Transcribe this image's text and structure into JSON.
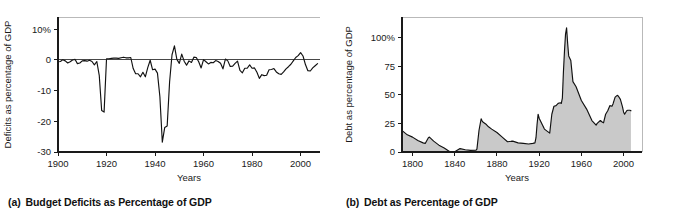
{
  "figure": {
    "panels": [
      {
        "id": "a",
        "caption_tag": "(a)",
        "caption_text": "Budget Deficits as Percentage of GDP"
      },
      {
        "id": "b",
        "caption_tag": "(b)",
        "caption_text": "Debt as Percentage of GDP"
      }
    ]
  },
  "chart_data": [
    {
      "type": "line",
      "panel": "a",
      "title": "Budget Deficits as Percentage of GDP",
      "xlabel": "Years",
      "ylabel": "Deficits as percentage of GDP",
      "xlim": [
        1900,
        2008
      ],
      "ylim": [
        -30,
        14
      ],
      "xticks": [
        1900,
        1920,
        1940,
        1960,
        1980,
        2000
      ],
      "xticklabels": [
        "1900",
        "1920",
        "1940",
        "1960",
        "1980",
        "2000"
      ],
      "yticks": [
        10,
        0,
        -10,
        -20,
        -30
      ],
      "yticklabels": [
        "10%",
        "0",
        "-10",
        "-20",
        "-30"
      ],
      "grid": false,
      "legend": "none",
      "zero_reference_line": 0,
      "series": [
        {
          "name": "Federal budget surplus/deficit as % of GDP",
          "x": [
            1900,
            1901,
            1902,
            1903,
            1904,
            1905,
            1906,
            1907,
            1908,
            1909,
            1910,
            1911,
            1912,
            1913,
            1914,
            1915,
            1916,
            1917,
            1918,
            1919,
            1920,
            1921,
            1922,
            1923,
            1924,
            1925,
            1926,
            1927,
            1928,
            1929,
            1930,
            1931,
            1932,
            1933,
            1934,
            1935,
            1936,
            1937,
            1938,
            1939,
            1940,
            1941,
            1942,
            1943,
            1944,
            1945,
            1946,
            1947,
            1948,
            1949,
            1950,
            1951,
            1952,
            1953,
            1954,
            1955,
            1956,
            1957,
            1958,
            1959,
            1960,
            1961,
            1962,
            1963,
            1964,
            1965,
            1966,
            1967,
            1968,
            1969,
            1970,
            1971,
            1972,
            1973,
            1974,
            1975,
            1976,
            1977,
            1978,
            1979,
            1980,
            1981,
            1982,
            1983,
            1984,
            1985,
            1986,
            1987,
            1988,
            1989,
            1990,
            1991,
            1992,
            1993,
            1994,
            1995,
            1996,
            1997,
            1998,
            1999,
            2000,
            2001,
            2002,
            2003,
            2004,
            2005,
            2006,
            2007
          ],
          "y": [
            -0.6,
            -0.5,
            0.1,
            -0.3,
            -1.0,
            -0.6,
            0.0,
            0.2,
            -1.2,
            -1.0,
            -0.3,
            -0.2,
            -0.4,
            -0.1,
            -0.5,
            -1.6,
            -0.5,
            -5.0,
            -16.5,
            -17.0,
            0.4,
            0.4,
            0.5,
            0.6,
            0.6,
            0.5,
            0.7,
            0.9,
            0.7,
            0.7,
            0.8,
            -2.8,
            -4.5,
            -4.5,
            -5.5,
            -4.0,
            -5.5,
            -2.5,
            -0.1,
            -3.2,
            -3.0,
            -4.3,
            -12.0,
            -26.8,
            -22.0,
            -21.5,
            -7.2,
            1.7,
            4.6,
            0.2,
            -1.1,
            1.9,
            -0.4,
            -1.7,
            -0.3,
            -0.8,
            0.9,
            0.8,
            -0.6,
            -2.6,
            0.1,
            -0.6,
            -1.3,
            -0.8,
            -0.9,
            -0.2,
            -0.5,
            -1.1,
            -2.9,
            0.3,
            -0.3,
            -2.1,
            -2.0,
            -1.1,
            -0.4,
            -3.4,
            -4.2,
            -2.7,
            -2.7,
            -1.6,
            -2.7,
            -2.6,
            -4.0,
            -6.0,
            -4.8,
            -5.1,
            -5.0,
            -3.2,
            -3.1,
            -2.8,
            -3.9,
            -4.5,
            -4.7,
            -3.9,
            -2.9,
            -2.2,
            -1.4,
            -0.3,
            0.8,
            1.4,
            2.4,
            1.3,
            -1.5,
            -3.5,
            -3.6,
            -2.6,
            -1.9,
            -1.2
          ]
        }
      ],
      "notes": [
        "Large deficits during World War I peak near -17% of GDP around 1918-1919.",
        "Largest deficit near -27% of GDP in 1943 during World War II.",
        "Small surpluses appear in the late 1990s, peaking near +2.4% in 2000."
      ]
    },
    {
      "type": "area",
      "panel": "b",
      "title": "Debt as Percentage of GDP",
      "xlabel": "Years",
      "ylabel": "Debt as percentage of GDP",
      "xlim": [
        1790,
        2008
      ],
      "ylim": [
        0,
        118
      ],
      "xticks": [
        1800,
        1840,
        1880,
        1920,
        1960,
        2000
      ],
      "xticklabels": [
        "1800",
        "1840",
        "1880",
        "1920",
        "1960",
        "2000"
      ],
      "yticks": [
        100,
        75,
        50,
        25,
        0
      ],
      "yticklabels": [
        "100%",
        "75",
        "50",
        "25",
        "0"
      ],
      "grid": false,
      "legend": "none",
      "fill_color": "#c9c9c9",
      "series": [
        {
          "name": "Federal debt held by the public as % of GDP",
          "x": [
            1791,
            1795,
            1800,
            1805,
            1810,
            1812,
            1815,
            1816,
            1820,
            1825,
            1830,
            1835,
            1836,
            1840,
            1845,
            1850,
            1855,
            1860,
            1861,
            1863,
            1865,
            1866,
            1867,
            1870,
            1872,
            1875,
            1880,
            1885,
            1890,
            1895,
            1900,
            1905,
            1910,
            1914,
            1916,
            1917,
            1918,
            1919,
            1920,
            1925,
            1930,
            1932,
            1934,
            1936,
            1938,
            1940,
            1941,
            1942,
            1943,
            1944,
            1945,
            1946,
            1947,
            1948,
            1950,
            1952,
            1955,
            1960,
            1965,
            1970,
            1974,
            1975,
            1978,
            1980,
            1981,
            1983,
            1985,
            1987,
            1989,
            1990,
            1992,
            1994,
            1995,
            1997,
            1999,
            2000,
            2001,
            2002,
            2003,
            2004,
            2005,
            2006,
            2007
          ],
          "y": [
            18.0,
            15.0,
            13.0,
            10.0,
            8.0,
            7.5,
            12.5,
            13.0,
            9.5,
            6.0,
            3.5,
            0.4,
            0.1,
            0.2,
            3.0,
            2.0,
            1.4,
            1.5,
            2.5,
            19.0,
            29.0,
            27.0,
            26.0,
            24.0,
            22.0,
            20.0,
            17.0,
            13.0,
            9.0,
            9.5,
            8.0,
            7.5,
            7.0,
            7.5,
            8.0,
            12.5,
            24.0,
            33.0,
            29.5,
            20.0,
            16.5,
            33.0,
            40.0,
            40.5,
            42.5,
            43.0,
            42.5,
            47.0,
            70.0,
            88.0,
            103.0,
            108.5,
            95.0,
            84.0,
            80.0,
            61.5,
            57.0,
            45.0,
            37.5,
            27.5,
            23.5,
            25.0,
            27.5,
            26.0,
            25.5,
            33.0,
            36.0,
            40.5,
            40.0,
            42.0,
            48.0,
            49.5,
            49.0,
            46.0,
            39.5,
            35.0,
            33.0,
            34.5,
            36.0,
            36.5,
            36.5,
            36.5,
            36.0
          ]
        }
      ],
      "notes": [
        "Debt is nearly eliminated around 1835-1836.",
        "Civil War raises debt to roughly 30% of GDP by 1865.",
        "World War II peak exceeds 100% of GDP around 1945-1946.",
        "Debt rises again through the 1980s and mid-1990s to near 50% of GDP."
      ]
    }
  ]
}
